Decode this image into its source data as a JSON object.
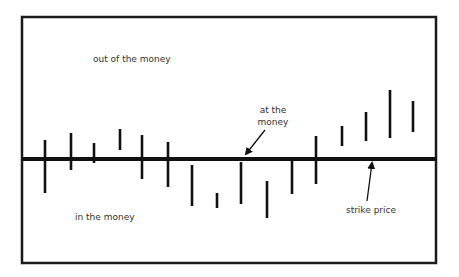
{
  "diagram": {
    "frame": {
      "x": 22,
      "y": 17,
      "width": 414,
      "height": 246,
      "stroke": "#1a1a1a"
    },
    "strike_line": {
      "y": 159,
      "x1": 22,
      "x2": 436,
      "stroke": "#111111"
    },
    "bars": [
      {
        "x": 45,
        "top": 140,
        "bottom": 193
      },
      {
        "x": 71,
        "top": 133,
        "bottom": 170
      },
      {
        "x": 94,
        "top": 143,
        "bottom": 163
      },
      {
        "x": 120,
        "top": 129,
        "bottom": 150
      },
      {
        "x": 142,
        "top": 135,
        "bottom": 179
      },
      {
        "x": 168,
        "top": 142,
        "bottom": 187
      },
      {
        "x": 192,
        "top": 165,
        "bottom": 206
      },
      {
        "x": 217,
        "top": 193,
        "bottom": 208
      },
      {
        "x": 241,
        "top": 162,
        "bottom": 204
      },
      {
        "x": 267,
        "top": 181,
        "bottom": 218
      },
      {
        "x": 292,
        "top": 161,
        "bottom": 194
      },
      {
        "x": 316,
        "top": 136,
        "bottom": 184
      },
      {
        "x": 342,
        "top": 126,
        "bottom": 146
      },
      {
        "x": 366,
        "top": 112,
        "bottom": 141
      },
      {
        "x": 390,
        "top": 90,
        "bottom": 138
      },
      {
        "x": 413,
        "top": 101,
        "bottom": 132
      }
    ],
    "labels": {
      "out_of_the_money": "out of the money",
      "in_the_money": "in the money",
      "at_the_money_line1": "at the",
      "at_the_money_line2": "money",
      "strike_price": "strike price"
    },
    "arrows": {
      "at_the_money": {
        "x1": 265,
        "y1": 130,
        "x2": 246,
        "y2": 154
      },
      "strike_price": {
        "x1": 367,
        "y1": 201,
        "x2": 372,
        "y2": 163
      }
    }
  }
}
